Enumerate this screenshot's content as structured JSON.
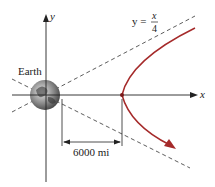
{
  "diagram": {
    "labels": {
      "y_axis": "y",
      "x_axis": "x",
      "earth": "Earth",
      "asymptote_lhs": "y =",
      "asymptote_num": "x",
      "asymptote_den": "4",
      "distance": "6000 mi"
    },
    "colors": {
      "trajectory": "#a52a2a",
      "axes": "#222222",
      "dashed": "#333333"
    }
  }
}
